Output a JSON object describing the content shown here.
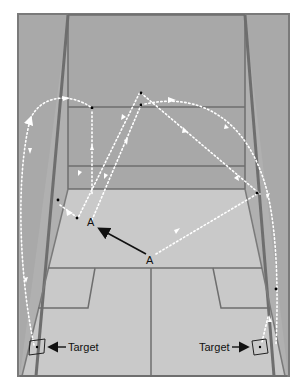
{
  "diagram": {
    "labels": {
      "point_a_near": "A",
      "point_a_far": "A",
      "target_left": "Target",
      "target_right": "Target"
    },
    "colors": {
      "background": "#ffffff",
      "frame": "#7a7a7a",
      "front_wall": "#a8a8a8",
      "side_wall": "#b0b0b0",
      "floor": "#c9c9c9",
      "court_lines": "#6e6e6e",
      "trajectory": "#ffffff",
      "arrow": "#111111"
    }
  }
}
